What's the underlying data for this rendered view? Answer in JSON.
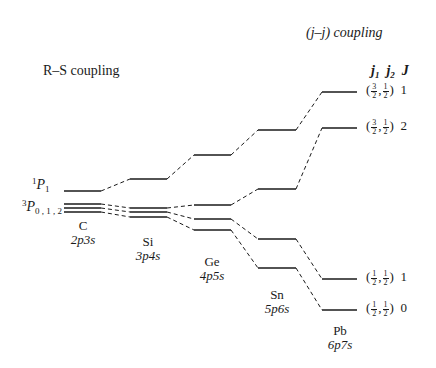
{
  "titles": {
    "rs": "R–S coupling",
    "jj": "(j–j) coupling"
  },
  "header": {
    "j1": "j",
    "j1_sub": "1",
    "j2": "j",
    "j2_sub": "2",
    "J": "J"
  },
  "left_labels": {
    "singlet": {
      "sup": "1",
      "P": "P",
      "sub": "1"
    },
    "triplet": {
      "sup": "3",
      "P": "P",
      "sub": "0 , 1 , 2"
    }
  },
  "elements": [
    {
      "symbol": "C",
      "config": "2p3s",
      "x": 83,
      "y_symbol": 219,
      "y_config": 233
    },
    {
      "symbol": "Si",
      "config": "3p4s",
      "x": 148,
      "y_symbol": 235,
      "y_config": 249
    },
    {
      "symbol": "Ge",
      "config": "4p5s",
      "x": 212,
      "y_symbol": 255,
      "y_config": 269
    },
    {
      "symbol": "Sn",
      "config": "5p6s",
      "x": 277,
      "y_symbol": 288,
      "y_config": 302
    },
    {
      "symbol": "Pb",
      "config": "6p7s",
      "x": 340,
      "y_symbol": 324,
      "y_config": 338
    }
  ],
  "right_labels": [
    {
      "j1_num": "3",
      "j1_den": "2",
      "j2_num": "1",
      "j2_den": "2",
      "J": "1",
      "y": 92
    },
    {
      "j1_num": "3",
      "j1_den": "2",
      "j2_num": "1",
      "j2_den": "2",
      "J": "2",
      "y": 128
    },
    {
      "j1_num": "1",
      "j1_den": "2",
      "j2_num": "1",
      "j2_den": "2",
      "J": "1",
      "y": 279
    },
    {
      "j1_num": "1",
      "j1_den": "2",
      "j2_num": "1",
      "j2_den": "2",
      "J": "0",
      "y": 310
    }
  ],
  "levels": {
    "columns": [
      {
        "element": "C",
        "x1": 64,
        "x2": 101,
        "y": [
          191,
          204,
          208,
          212
        ]
      },
      {
        "element": "Si",
        "x1": 130,
        "x2": 167,
        "y": [
          179,
          208,
          212,
          217
        ]
      },
      {
        "element": "Ge",
        "x1": 194,
        "x2": 231,
        "y": [
          155,
          205,
          219,
          230
        ]
      },
      {
        "element": "Sn",
        "x1": 258,
        "x2": 296,
        "y": [
          130,
          189,
          239,
          268
        ]
      },
      {
        "element": "Pb",
        "x1": 322,
        "x2": 357,
        "y": [
          92,
          128,
          279,
          310
        ]
      }
    ]
  },
  "colors": {
    "line": "#1a1a1a",
    "background": "#ffffff"
  }
}
